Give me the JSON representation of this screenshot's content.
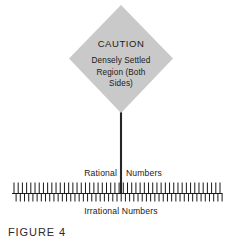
{
  "figure": {
    "caption": "FIGURE 4",
    "background_color": "#ffffff",
    "ink_color": "#1a1a1a"
  },
  "warning_sign": {
    "shape": "diamond",
    "fill_color": "#c9c9c9",
    "title": "CAUTION",
    "body_lines": [
      "Densely Settled",
      "Region (Both",
      "Sides)"
    ],
    "post": {
      "color": "#262626"
    }
  },
  "number_line": {
    "axis_color": "#1a1a1a",
    "tick_color": "#1a1a1a",
    "above_label_left": "Rational",
    "above_label_right": "Numbers",
    "below_label": "Irrational  Numbers",
    "tick_count_up": 50,
    "tick_count_down": 50,
    "tick_up_length": 11,
    "tick_down_length": 8
  },
  "chart_data": {
    "type": "line",
    "title": "FIGURE 4",
    "xlabel": "Irrational  Numbers",
    "ylabel": "",
    "annotations": [
      "CAUTION",
      "Densely Settled",
      "Region (Both",
      "Sides)",
      "Rational",
      "Numbers"
    ],
    "series": [
      {
        "name": "Rational Numbers",
        "tick_direction": "up",
        "tick_count": 50,
        "x_range": [
          14,
          220
        ]
      },
      {
        "name": "Irrational Numbers",
        "tick_direction": "down",
        "tick_count": 50,
        "x_range": [
          14,
          220
        ]
      }
    ],
    "axis_range": [
      14,
      222
    ],
    "grid": false,
    "legend": "none"
  }
}
